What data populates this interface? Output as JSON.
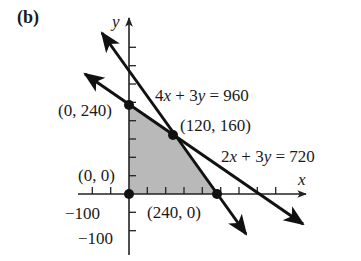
{
  "panel_label": "(b)",
  "axes": {
    "x_label": "x",
    "y_label": "y",
    "tick_step_units": 50,
    "neg_x_tick_label": "−100",
    "neg_y_tick_label": "−100"
  },
  "lines": [
    {
      "name": "constraint-1",
      "equation_parts": [
        "4",
        "x",
        " + 3",
        "y",
        " = 960"
      ],
      "equation": "4x + 3y = 960",
      "x_intercept": [
        240,
        0
      ],
      "y_intercept": [
        0,
        320
      ]
    },
    {
      "name": "constraint-2",
      "equation_parts": [
        "2",
        "x",
        " + 3",
        "y",
        " = 720"
      ],
      "equation": "2x + 3y = 720",
      "x_intercept": [
        360,
        0
      ],
      "y_intercept": [
        0,
        240
      ]
    }
  ],
  "vertices": [
    {
      "label": "(0, 240)",
      "x": 0,
      "y": 240
    },
    {
      "label": "(120, 160)",
      "x": 120,
      "y": 160
    },
    {
      "label": "(0, 0)",
      "x": 0,
      "y": 0
    },
    {
      "label": "(240, 0)",
      "x": 240,
      "y": 0
    }
  ],
  "feasible_region": {
    "polygon": [
      [
        0,
        0
      ],
      [
        0,
        240
      ],
      [
        120,
        160
      ],
      [
        240,
        0
      ]
    ],
    "fill_color": "#b9b9b9"
  },
  "colors": {
    "ink": "#111111",
    "shade": "#b9b9b9"
  }
}
